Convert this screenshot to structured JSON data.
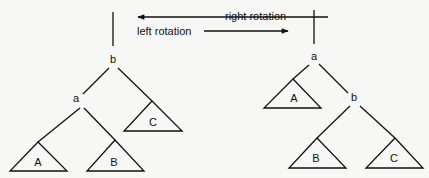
{
  "arrows": {
    "right_rotation": {
      "label": "right rotation",
      "from": [
        328,
        17
      ],
      "to": [
        138,
        17
      ],
      "label_pos": [
        225,
        20
      ]
    },
    "left_rotation": {
      "label": "left rotation",
      "from": [
        204,
        31
      ],
      "to": [
        288,
        31
      ],
      "label_pos": [
        137,
        35
      ]
    }
  },
  "left_tree": {
    "root_stub": [
      [
        113,
        12
      ],
      [
        113,
        46
      ]
    ],
    "nodes": [
      {
        "id": "b",
        "label": "b",
        "x": 113,
        "y": 63
      },
      {
        "id": "a",
        "label": "a",
        "x": 76,
        "y": 102
      }
    ],
    "edges": [
      [
        [
          109,
          68
        ],
        [
          83,
          94
        ]
      ],
      [
        [
          118,
          68
        ],
        [
          152,
          101
        ]
      ],
      [
        [
          80,
          108
        ],
        [
          38,
          142
        ]
      ],
      [
        [
          84,
          108
        ],
        [
          115,
          140
        ]
      ]
    ],
    "subtrees": [
      {
        "label": "C",
        "apex": [
          152,
          101
        ],
        "left": [
          124,
          131
        ],
        "right": [
          182,
          131
        ],
        "label_pos": [
          153,
          126
        ]
      },
      {
        "label": "A",
        "apex": [
          38,
          142
        ],
        "left": [
          10,
          171
        ],
        "right": [
          67,
          171
        ],
        "label_pos": [
          38,
          166
        ]
      },
      {
        "label": "B",
        "apex": [
          115,
          140
        ],
        "left": [
          87,
          171
        ],
        "right": [
          144,
          171
        ],
        "label_pos": [
          114,
          166
        ]
      }
    ]
  },
  "right_tree": {
    "root_stub": [
      [
        314,
        10
      ],
      [
        314,
        44
      ]
    ],
    "nodes": [
      {
        "id": "a",
        "label": "a",
        "x": 314,
        "y": 60
      },
      {
        "id": "b",
        "label": "b",
        "x": 354,
        "y": 101
      }
    ],
    "edges": [
      [
        [
          309,
          65
        ],
        [
          293,
          79
        ]
      ],
      [
        [
          319,
          64
        ],
        [
          348,
          93
        ]
      ],
      [
        [
          350,
          106
        ],
        [
          317,
          138
        ]
      ],
      [
        [
          360,
          106
        ],
        [
          395,
          138
        ]
      ]
    ],
    "subtrees": [
      {
        "label": "A",
        "apex": [
          293,
          79
        ],
        "left": [
          264,
          108
        ],
        "right": [
          321,
          108
        ],
        "label_pos": [
          294,
          102
        ]
      },
      {
        "label": "B",
        "apex": [
          317,
          138
        ],
        "left": [
          289,
          168
        ],
        "right": [
          346,
          168
        ],
        "label_pos": [
          316,
          162
        ]
      },
      {
        "label": "C",
        "apex": [
          395,
          138
        ],
        "left": [
          366,
          168
        ],
        "right": [
          423,
          168
        ],
        "label_pos": [
          394,
          162
        ]
      }
    ]
  }
}
